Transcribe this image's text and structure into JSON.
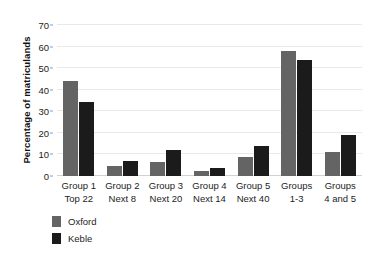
{
  "chart_data": {
    "type": "bar",
    "title": "",
    "subtitle": "",
    "xlabel": "",
    "ylabel": "Percentage of matriculands",
    "ylim": [
      0,
      70
    ],
    "yticks": [
      0,
      10,
      20,
      30,
      40,
      50,
      60,
      70
    ],
    "grid": true,
    "legend_position": "bottom-left",
    "categories": [
      "Group 1\nTop 22",
      "Group 2\nNext 8",
      "Group 3\nNext 20",
      "Group 4\nNext 14",
      "Group 5\nNext 40",
      "Groups\n1-3",
      "Groups\n4 and 5"
    ],
    "category_lines": [
      {
        "line1": "Group 1",
        "line2": "Top 22"
      },
      {
        "line1": "Group 2",
        "line2": "Next 8"
      },
      {
        "line1": "Group 3",
        "line2": "Next 20"
      },
      {
        "line1": "Group 4",
        "line2": "Next 14"
      },
      {
        "line1": "Group 5",
        "line2": "Next 40"
      },
      {
        "line1": "Groups",
        "line2": "1-3"
      },
      {
        "line1": "Groups",
        "line2": "4 and 5"
      }
    ],
    "series": [
      {
        "name": "Oxford",
        "color": "#646464",
        "values": [
          44,
          4.5,
          6.5,
          2.5,
          9,
          58,
          11
        ]
      },
      {
        "name": "Keble",
        "color": "#1b1b1b",
        "values": [
          34.5,
          7,
          12,
          3.7,
          14,
          54,
          19
        ]
      }
    ]
  },
  "legend": {
    "items": [
      {
        "label": "Oxford",
        "color": "#646464"
      },
      {
        "label": "Keble",
        "color": "#1b1b1b"
      }
    ]
  },
  "colors": {
    "oxford": "#646464",
    "keble": "#1b1b1b",
    "gridline": "#e9e9e9",
    "background": "#ffffff",
    "text": "#1d1d1d"
  }
}
